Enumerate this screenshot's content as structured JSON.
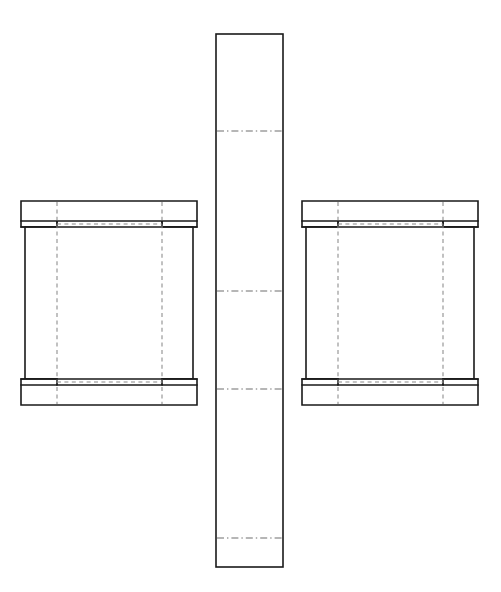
{
  "document": {
    "title": "Packaging Dieline - Flat Pattern",
    "line_colors": {
      "cut": "#1a1a1a",
      "fold_dashed": "#8a8a8a",
      "fold_dashdot": "#6e6e6e",
      "background": "#ffffff",
      "panel_fill": "#ffffff"
    }
  },
  "canvas": {
    "width": 501,
    "height": 592
  },
  "chart_data": {
    "type": "diagram",
    "parts": [
      {
        "name": "center-strip",
        "label": "Center Strip",
        "outline": {
          "x": 216,
          "y": 34,
          "width": 67,
          "height": 533
        },
        "fold_lines_horizontal": [
          131,
          291,
          389,
          538
        ],
        "fold_line_style": "dash-dot"
      },
      {
        "name": "left-panel",
        "label": "Left Panel",
        "flap_outline": {
          "x": 21,
          "y": 201,
          "width": 176,
          "height": 204
        },
        "body_outline": {
          "x": 25,
          "y": 227,
          "width": 168,
          "height": 152
        },
        "top_flap": {
          "x": 21,
          "y": 201,
          "width": 176,
          "height": 26
        },
        "bottom_flap": {
          "x": 21,
          "y": 379,
          "width": 176,
          "height": 26
        },
        "fold_lines_vertical": [
          57,
          162
        ],
        "fold_lines_horizontal": [
          227,
          379
        ],
        "slot_cuts": [
          {
            "x": 21,
            "y": 221,
            "width": 36,
            "height": 6
          },
          {
            "x": 162,
            "y": 221,
            "width": 35,
            "height": 6
          },
          {
            "x": 21,
            "y": 373,
            "width": 36,
            "height": 6
          },
          {
            "x": 162,
            "y": 373,
            "width": 35,
            "height": 6
          }
        ]
      },
      {
        "name": "right-panel",
        "label": "Right Panel",
        "flap_outline": {
          "x": 302,
          "y": 201,
          "width": 176,
          "height": 204
        },
        "body_outline": {
          "x": 306,
          "y": 227,
          "width": 168,
          "height": 152
        },
        "top_flap": {
          "x": 302,
          "y": 201,
          "width": 176,
          "height": 26
        },
        "bottom_flap": {
          "x": 302,
          "y": 379,
          "width": 176,
          "height": 26
        },
        "fold_lines_vertical": [
          338,
          443
        ],
        "fold_lines_horizontal": [
          227,
          379
        ],
        "slot_cuts": [
          {
            "x": 302,
            "y": 221,
            "width": 36,
            "height": 6
          },
          {
            "x": 443,
            "y": 221,
            "width": 35,
            "height": 6
          },
          {
            "x": 302,
            "y": 373,
            "width": 36,
            "height": 6
          },
          {
            "x": 443,
            "y": 373,
            "width": 35,
            "height": 6
          }
        ]
      }
    ],
    "legend": [],
    "annotations": [],
    "xlabel": "",
    "ylabel": ""
  }
}
